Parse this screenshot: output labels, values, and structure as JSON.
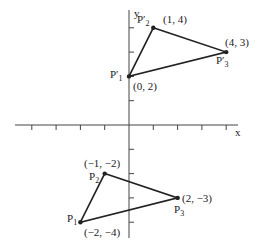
{
  "axes": {
    "x_label": "x",
    "y_label": "y",
    "origin_px": [
      129,
      125
    ],
    "unit_px": 24.3,
    "x_ticks": [
      -4,
      -3,
      -2,
      -1,
      1,
      2,
      3,
      4
    ],
    "y_ticks": [
      -4,
      -3,
      -2,
      -1,
      1,
      2,
      3,
      4
    ]
  },
  "triangle_original": {
    "points": [
      {
        "name": "P",
        "sub": "1",
        "coord_label": "(−2, −4)",
        "x": -2,
        "y": -4
      },
      {
        "name": "P",
        "sub": "2",
        "coord_label": "(−1, −2)",
        "x": -1,
        "y": -2
      },
      {
        "name": "P",
        "sub": "3",
        "coord_label": "(2, −3)",
        "x": 2,
        "y": -3
      }
    ]
  },
  "triangle_transformed": {
    "points": [
      {
        "name": "P′",
        "sub": "1",
        "coord_label": "(0, 2)",
        "x": 0,
        "y": 2
      },
      {
        "name": "P′",
        "sub": "2",
        "coord_label": "(1, 4)",
        "x": 1,
        "y": 4
      },
      {
        "name": "P′",
        "sub": "3",
        "coord_label": "(4, 3)",
        "x": 4,
        "y": 3
      }
    ]
  },
  "colors": {
    "line": "#222222",
    "axis": "#444444",
    "background": "#ffffff"
  }
}
